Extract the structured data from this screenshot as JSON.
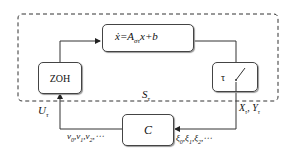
{
  "diagram": {
    "outer_region": {
      "label": "S",
      "label_sub": "τ"
    },
    "blocks": {
      "plant": {
        "eq_lhs": "ẋ",
        "eq_mid": "=A",
        "eq_sub": "στ",
        "eq_rhs": "x+b"
      },
      "zoh": {
        "label": "ZOH"
      },
      "sampler": {
        "label": "τ"
      },
      "controller": {
        "label": "C"
      }
    },
    "signals": {
      "u": {
        "main": "U",
        "sub": "τ"
      },
      "xy": {
        "x": "X",
        "x_sub": "τ",
        "sep": ", ",
        "y": "Y",
        "y_sub": "τ"
      },
      "v_seq": {
        "text": "v",
        "s0": "0",
        "s1": "1",
        "s2": "2",
        "ellipsis": "⋯"
      },
      "xi_seq": {
        "text": "ξ",
        "s0": "0",
        "s1": "1",
        "s2": "2",
        "ellipsis": "⋯"
      }
    },
    "colors": {
      "line": "#333333",
      "dash": "#333333",
      "box_border": "#444444"
    }
  }
}
